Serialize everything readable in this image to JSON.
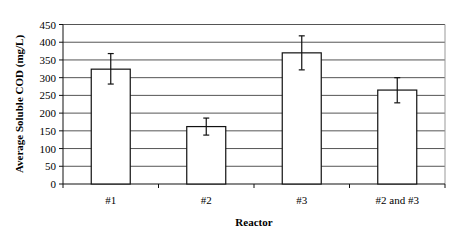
{
  "chart_data": {
    "type": "bar",
    "title": "",
    "xlabel": "Reactor",
    "ylabel": "Average Soluble COD (mg/L)",
    "categories": [
      "#1",
      "#2",
      "#3",
      "#2 and #3"
    ],
    "values": [
      324,
      162,
      370,
      265
    ],
    "error_bars": [
      {
        "low": 282,
        "high": 368
      },
      {
        "low": 138,
        "high": 186
      },
      {
        "low": 322,
        "high": 418
      },
      {
        "low": 229,
        "high": 300
      }
    ],
    "ylim": [
      0,
      450
    ],
    "yticks": [
      0,
      50,
      100,
      150,
      200,
      250,
      300,
      350,
      400,
      450
    ],
    "grid": true,
    "legend": null,
    "colors": {
      "bar_fill": "#ffffff",
      "bar_stroke": "#111111",
      "grid": "#555555"
    }
  }
}
